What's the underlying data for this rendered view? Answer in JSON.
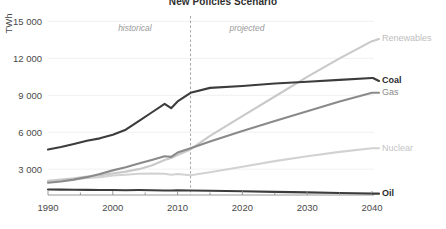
{
  "chart_data": {
    "type": "line",
    "title": "New Policies Scenario",
    "xlabel": "",
    "ylabel": "TWh",
    "ylim": [
      900,
      15600
    ],
    "xlim": [
      1990,
      2040
    ],
    "grid": true,
    "legend_position": "right-inline",
    "y_ticks": [
      "3 000",
      "6 000",
      "9 000",
      "12 000",
      "15 000"
    ],
    "y_tick_values": [
      3000,
      6000,
      9000,
      12000,
      15000
    ],
    "x_ticks": [
      "1990",
      "2000",
      "2010",
      "2020",
      "2030",
      "2040"
    ],
    "x_tick_values": [
      1990,
      2000,
      2010,
      2020,
      2030,
      2040
    ],
    "x_minor_tick_values": [
      1995,
      2005,
      2015,
      2025,
      2035
    ],
    "annotations": [
      {
        "text": "historical",
        "x": 2006,
        "y": 14200
      },
      {
        "text": "projected",
        "x": 2018,
        "y": 14200
      }
    ],
    "divider": {
      "x": 2012,
      "style": "dashed",
      "color": "#9a9a9a"
    },
    "x": [
      1990,
      1992,
      1994,
      1996,
      1998,
      2000,
      2002,
      2004,
      2006,
      2008,
      2009,
      2010,
      2012,
      2015,
      2020,
      2025,
      2030,
      2035,
      2040
    ],
    "series": [
      {
        "name": "Renewables",
        "color": "#c9c9c9",
        "label_color": "#bdbdbd",
        "label_bold": false,
        "width": 2.1,
        "values": [
          2050,
          2150,
          2250,
          2400,
          2500,
          2650,
          2800,
          3000,
          3300,
          3750,
          3900,
          4150,
          4600,
          5700,
          7300,
          8900,
          10500,
          12000,
          13400
        ]
      },
      {
        "name": "Coal",
        "color": "#3c3c3c",
        "label_color": "#2b2b2b",
        "label_bold": true,
        "width": 2.1,
        "values": [
          4600,
          4800,
          5050,
          5300,
          5500,
          5800,
          6200,
          6900,
          7600,
          8300,
          7950,
          8500,
          9200,
          9600,
          9750,
          9950,
          10100,
          10250,
          10400
        ]
      },
      {
        "name": "Gas",
        "color": "#8a8a8a",
        "label_color": "#8a8a8a",
        "label_bold": false,
        "width": 2.1,
        "values": [
          1900,
          2000,
          2150,
          2350,
          2600,
          2900,
          3150,
          3450,
          3750,
          4050,
          4000,
          4350,
          4700,
          5250,
          6100,
          6900,
          7700,
          8500,
          9200
        ]
      },
      {
        "name": "Nuclear",
        "color": "#d2d2d2",
        "label_color": "#c4c4c4",
        "label_bold": false,
        "width": 2.1,
        "values": [
          1950,
          2080,
          2180,
          2280,
          2350,
          2480,
          2550,
          2620,
          2650,
          2620,
          2550,
          2600,
          2500,
          2750,
          3200,
          3650,
          4050,
          4400,
          4700
        ]
      },
      {
        "name": "Oil",
        "color": "#3c3c3c",
        "label_color": "#2b2b2b",
        "label_bold": true,
        "width": 2.1,
        "values": [
          1350,
          1340,
          1330,
          1320,
          1310,
          1300,
          1290,
          1300,
          1290,
          1270,
          1260,
          1290,
          1270,
          1250,
          1200,
          1150,
          1110,
          1060,
          1010
        ]
      }
    ]
  }
}
